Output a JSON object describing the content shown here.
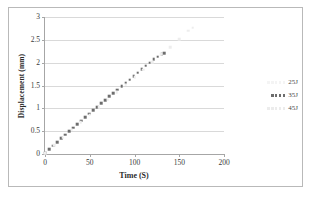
{
  "chart_data": {
    "type": "scatter",
    "title": "",
    "xlabel": "Time (S)",
    "ylabel": "Displacement (mm)",
    "xlim": [
      0,
      200
    ],
    "ylim": [
      0,
      3
    ],
    "xticks": [
      "0",
      "50",
      "100",
      "150",
      "200"
    ],
    "yticks": [
      "0",
      "0.5",
      "1",
      "1.5",
      "2",
      "2.5",
      "3"
    ],
    "xtick_values": [
      0,
      50,
      100,
      150,
      200
    ],
    "ytick_values": [
      0,
      0.5,
      1,
      1.5,
      2,
      2.5,
      3
    ],
    "grid": "horizontal",
    "legend_position": "right",
    "series": [
      {
        "name": "25J",
        "style": "dotted-faint",
        "color": "#ededed",
        "x": [],
        "y": []
      },
      {
        "name": "35J",
        "style": "square-markers",
        "color": "#6d6d6d",
        "x": [
          0,
          4.5,
          9,
          13.5,
          18,
          22.5,
          27,
          31.5,
          36,
          40.5,
          45,
          49.5,
          54,
          58.5,
          63,
          67.5,
          72,
          76.5,
          81,
          85.5,
          90,
          94.5,
          99,
          103.5,
          108,
          112.5,
          117,
          121.5,
          126,
          130.5,
          133
        ],
        "y": [
          0.03,
          0.1,
          0.18,
          0.26,
          0.34,
          0.42,
          0.5,
          0.58,
          0.65,
          0.73,
          0.81,
          0.88,
          0.96,
          1.03,
          1.11,
          1.18,
          1.26,
          1.33,
          1.41,
          1.48,
          1.56,
          1.63,
          1.71,
          1.78,
          1.86,
          1.93,
          2.0,
          2.07,
          2.13,
          2.18,
          2.21
        ]
      },
      {
        "name": "45J",
        "style": "dotted-faint",
        "color": "#f0f0f0",
        "x": [
          0,
          10,
          20,
          30,
          40,
          50,
          60,
          70,
          80,
          90,
          100,
          110,
          120,
          130,
          140,
          150,
          160,
          165
        ],
        "y": [
          0.02,
          0.19,
          0.36,
          0.53,
          0.7,
          0.86,
          1.02,
          1.19,
          1.35,
          1.52,
          1.68,
          1.85,
          2.01,
          2.18,
          2.34,
          2.51,
          2.7,
          2.77
        ]
      }
    ]
  },
  "legend": {
    "entries": [
      {
        "label": "25J"
      },
      {
        "label": "35J"
      },
      {
        "label": "45J"
      }
    ]
  }
}
